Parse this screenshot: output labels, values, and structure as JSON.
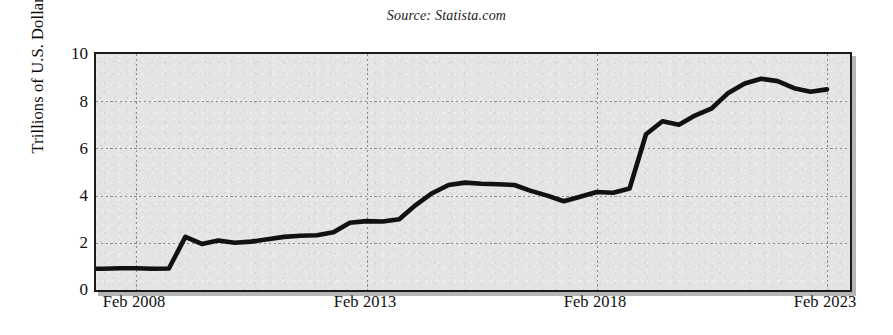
{
  "figure": {
    "source_note": "Source: Statista.com",
    "background_color": "#ffffff",
    "plot_background_color": "#e4e4e4",
    "line_color": "#111111",
    "grid_color": "#8c8c8c",
    "axis_color": "#1a1a1a"
  },
  "axes": {
    "y_title": "Trillions of U.S. Dollars",
    "y_ticks": [
      "0",
      "2",
      "4",
      "6",
      "8",
      "10"
    ],
    "x_ticks": [
      "Feb 2008",
      "Feb 2013",
      "Feb 2018",
      "Feb 2023"
    ]
  },
  "chart_data": {
    "type": "line",
    "title": "",
    "subtitle": "",
    "annotation": "Source: Statista.com",
    "xlabel": "",
    "ylabel": "Trillions of U.S. Dollars",
    "ylim": [
      0,
      10
    ],
    "xlim": [
      "Feb 2007",
      "Feb 2024"
    ],
    "grid": true,
    "grid_style": "dotted",
    "legend": "none",
    "y_ticks": [
      0,
      2,
      4,
      6,
      8,
      10
    ],
    "x_ticks": [
      "Feb 2008",
      "Feb 2013",
      "Feb 2018",
      "Feb 2023"
    ],
    "x_tick_positions": [
      134,
      365,
      595,
      825
    ],
    "series": [
      {
        "name": "U.S. Federal Reserve total assets",
        "color": "#111111",
        "x": [
          "Feb 2007",
          "May 2007",
          "Aug 2007",
          "Nov 2007",
          "Feb 2008",
          "May 2008",
          "Aug 2008",
          "Oct 2008",
          "Nov 2008",
          "Jan 2009",
          "Mar 2009",
          "Jun 2009",
          "Sep 2009",
          "Dec 2009",
          "Mar 2010",
          "Aug 2010",
          "Feb 2011",
          "Aug 2011",
          "Feb 2012",
          "Aug 2012",
          "Feb 2013",
          "Aug 2013",
          "Feb 2014",
          "Aug 2014",
          "Feb 2015",
          "Feb 2016",
          "Feb 2017",
          "Feb 2018",
          "Aug 2018",
          "Feb 2019",
          "Aug 2019",
          "Oct 2019",
          "Dec 2019",
          "Feb 2020",
          "Mar 2020",
          "Apr 2020",
          "Jun 2020",
          "Aug 2020",
          "Dec 2020",
          "Mar 2021",
          "Aug 2021",
          "Dec 2021",
          "Apr 2022",
          "Aug 2022",
          "Dec 2022",
          "Jan 2023",
          "Feb 2023"
        ],
        "values": [
          0.9,
          0.9,
          0.9,
          0.92,
          0.92,
          0.9,
          0.91,
          2.25,
          1.95,
          2.1,
          2.0,
          2.05,
          2.15,
          2.25,
          2.3,
          2.32,
          2.45,
          2.85,
          2.92,
          2.9,
          3.0,
          3.6,
          4.1,
          4.45,
          4.55,
          4.5,
          4.48,
          4.45,
          4.2,
          4.0,
          3.76,
          3.95,
          4.15,
          4.12,
          4.3,
          6.6,
          7.15,
          7.0,
          7.4,
          7.7,
          8.35,
          8.75,
          8.95,
          8.85,
          8.55,
          8.4,
          8.5
        ]
      }
    ],
    "key_points": [
      {
        "label": "pre-crisis plateau",
        "value": 0.9
      },
      {
        "label": "2008 crisis jump",
        "value": 2.25
      },
      {
        "label": "QE plateau 2014-2018",
        "value": 4.5
      },
      {
        "label": "balance sheet runoff trough 2019",
        "value": 3.76
      },
      {
        "label": "COVID expansion peak 2022",
        "value": 8.95
      },
      {
        "label": "final value Feb 2023",
        "value": 8.5
      }
    ]
  }
}
